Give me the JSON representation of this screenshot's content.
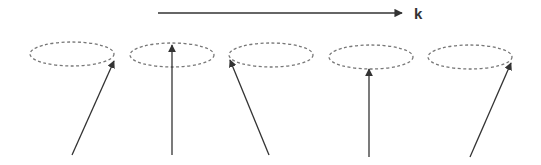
{
  "diagram": {
    "wave_vector_label": "k",
    "line_color": "#333333",
    "ellipse_color": "#777777",
    "k_arrow": {
      "x1": 158,
      "y1": 13,
      "x2": 402,
      "y2": 13
    },
    "cones": [
      {
        "cx": 72,
        "cy": 54,
        "rx": 42,
        "ry": 12,
        "base": [
          72,
          155
        ],
        "tip": [
          114,
          61
        ]
      },
      {
        "cx": 172,
        "cy": 55,
        "rx": 42,
        "ry": 12,
        "base": [
          172,
          155
        ],
        "tip": [
          172,
          45
        ]
      },
      {
        "cx": 271,
        "cy": 55,
        "rx": 42,
        "ry": 12,
        "base": [
          269,
          155
        ],
        "tip": [
          230,
          60
        ]
      },
      {
        "cx": 371,
        "cy": 57,
        "rx": 42,
        "ry": 12,
        "base": [
          369,
          157
        ],
        "tip": [
          369,
          69
        ]
      },
      {
        "cx": 470,
        "cy": 57,
        "rx": 42,
        "ry": 12,
        "base": [
          470,
          157
        ],
        "tip": [
          511,
          63
        ]
      }
    ]
  }
}
